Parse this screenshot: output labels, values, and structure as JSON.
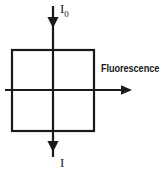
{
  "diagram": {
    "type": "optical-fluorescence-schematic",
    "background_color": "#ffffff",
    "stroke_color": "#1a1a1a",
    "labels": {
      "incident_beam": "I",
      "incident_beam_subscript": "0",
      "transmitted_beam": "I",
      "fluorescence": "Fluorescence"
    },
    "geometry": {
      "sample_cell": {
        "x": 12,
        "y": 50,
        "width": 82,
        "height": 81
      },
      "vertical_axis_x": 53,
      "horizontal_axis_y": 90,
      "incident_arrow": {
        "x": 53,
        "y_start": 6,
        "y_end": 27
      },
      "transmitted_arrow": {
        "x": 53,
        "y_start": 131,
        "y_end": 151
      },
      "fluorescence_arrow": {
        "y": 90,
        "x_start": 5,
        "x_end": 131
      }
    }
  }
}
